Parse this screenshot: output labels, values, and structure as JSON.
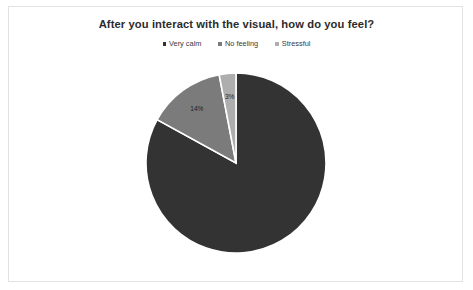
{
  "chart": {
    "title": "After you interact with the visual, how do you feel?",
    "legend": [
      {
        "label": "Very calm",
        "color": "#333333"
      },
      {
        "label": "No feeling",
        "color": "#7b7b7b"
      },
      {
        "label": "Stressful",
        "color": "#aeaeae"
      }
    ]
  },
  "chart_data": {
    "type": "pie",
    "title": "After you interact with the visual, how do you feel?",
    "xlabel": "",
    "ylabel": "",
    "legend_position": "top",
    "grid": false,
    "start_angle_deg": 0,
    "direction": "clockwise",
    "categories": [
      "Very calm",
      "No feeling",
      "Stressful"
    ],
    "values": [
      83,
      14,
      3
    ],
    "labels": [
      "",
      "14%",
      "3%"
    ],
    "colors": [
      "#333333",
      "#7b7b7b",
      "#aeaeae"
    ],
    "slices": [
      {
        "name": "Very calm",
        "value": 83,
        "label": "",
        "color": "#333333"
      },
      {
        "name": "No feeling",
        "value": 14,
        "label": "14%",
        "color": "#7b7b7b"
      },
      {
        "name": "Stressful",
        "value": 3,
        "label": "3%",
        "color": "#aeaeae"
      }
    ]
  }
}
